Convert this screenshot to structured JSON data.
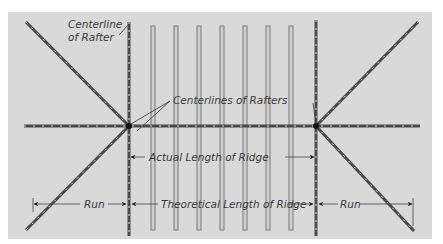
{
  "labels": {
    "centerline_of_rafter_1": "Centerline",
    "centerline_of_rafter_2": "of Rafter",
    "centerlines_of_rafters": "Centerlines of Rafters",
    "actual_length_of_ridge": "Actual Length of Ridge",
    "theoretical_length_of_ridge": "Theoretical Length of Ridge",
    "run_left": "Run",
    "run_right": "Run"
  },
  "colors": {
    "background": "#d9d9d9",
    "line": "#555555",
    "rafter_fill": "#bdbdbd",
    "text": "#3a3a3a"
  }
}
